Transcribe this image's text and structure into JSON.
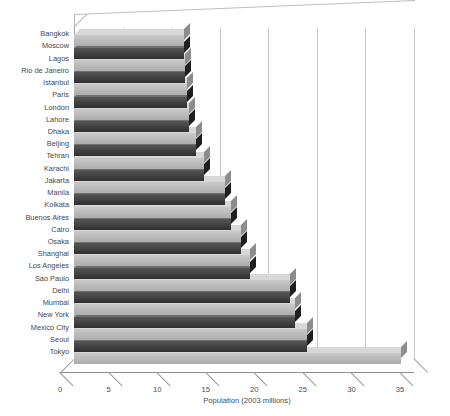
{
  "chart_data": {
    "type": "bar",
    "orientation": "horizontal",
    "title": "",
    "xlabel": "Population (2003 millions)",
    "ylabel": "",
    "xlim": [
      0,
      35
    ],
    "xticks": [
      0,
      5,
      10,
      15,
      20,
      25,
      30,
      35
    ],
    "grid": true,
    "legend": "none",
    "style": "3d-bar",
    "colors": {
      "dark_bar": "#3a3a3a",
      "light_bar": "#b8b8b8",
      "gridline": "#c9c9c9",
      "axis": "#8f8f8f",
      "text": "#474747",
      "background": "#ffffff"
    },
    "categories": [
      "Bangkok",
      "Moscow",
      "Lagos",
      "Rio de Janeiro",
      "Istanbul",
      "Paris",
      "London",
      "Lahore",
      "Dhaka",
      "Beijing",
      "Tehran",
      "Karachi",
      "Jakarta",
      "Manila",
      "Kolkata",
      "Buenos Aires",
      "Cairo",
      "Osaka",
      "Shanghai",
      "Los Angeles",
      "Sao Paulo",
      "Delhi",
      "Mumbai",
      "New York",
      "Mexico City",
      "Seoul",
      "Tokyo"
    ],
    "values": [
      11.3,
      11.3,
      11.4,
      11.4,
      11.6,
      11.6,
      11.8,
      11.8,
      12.6,
      12.6,
      13.4,
      13.4,
      15.5,
      15.5,
      16.2,
      16.2,
      17.2,
      17.2,
      18.1,
      18.1,
      22.2,
      22.2,
      22.8,
      22.8,
      24.0,
      24.0,
      33.7
    ],
    "bar_shades": [
      "light",
      "dark",
      "light",
      "dark",
      "light",
      "dark",
      "light",
      "dark",
      "light",
      "dark",
      "light",
      "dark",
      "light",
      "dark",
      "light",
      "dark",
      "light",
      "dark",
      "light",
      "dark",
      "light",
      "dark",
      "light",
      "dark",
      "light",
      "dark",
      "light"
    ]
  }
}
